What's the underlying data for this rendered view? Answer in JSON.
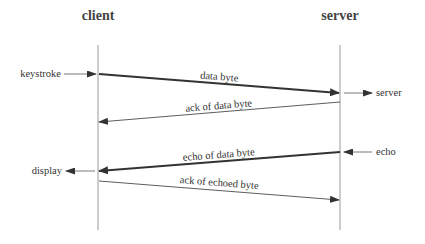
{
  "diagram": {
    "type": "sequence",
    "colors": {
      "line": "#333333",
      "lifeline": "#9a9a9a",
      "text": "#333333",
      "background": "#ffffff"
    },
    "participants": [
      {
        "id": "client",
        "label": "client",
        "x": 98
      },
      {
        "id": "server",
        "label": "server",
        "x": 340
      }
    ],
    "messages": [
      {
        "label": "data byte",
        "from": "client",
        "to": "server",
        "weight": "thick"
      },
      {
        "label": "ack of data byte",
        "from": "server",
        "to": "client",
        "weight": "thin"
      },
      {
        "label": "echo of data byte",
        "from": "server",
        "to": "client",
        "weight": "thick"
      },
      {
        "label": "ack of echoed byte",
        "from": "client",
        "to": "server",
        "weight": "thin"
      }
    ],
    "external_events": [
      {
        "label": "keystroke",
        "side": "client",
        "direction": "in"
      },
      {
        "label": "server",
        "side": "server",
        "direction": "out"
      },
      {
        "label": "echo",
        "side": "server",
        "direction": "in"
      },
      {
        "label": "display",
        "side": "client",
        "direction": "out"
      }
    ]
  }
}
